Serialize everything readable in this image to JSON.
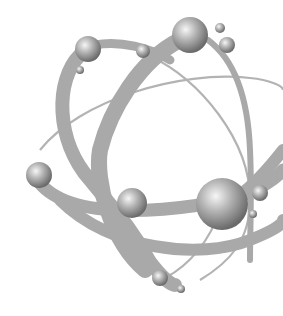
{
  "image": {
    "subject": "atom-illustration",
    "background": "#ffffff",
    "orbit_color": "#a9a9a9",
    "thin_orbit_color": "#b0b0b0",
    "sphere_highlight": "#f4f4f4",
    "sphere_mid": "#a8a8a8",
    "sphere_shadow": "#6e6e6e"
  },
  "spheres": [
    {
      "cx": 88,
      "cy": 49,
      "r": 13
    },
    {
      "cx": 143,
      "cy": 51,
      "r": 7
    },
    {
      "cx": 190,
      "cy": 35,
      "r": 18
    },
    {
      "cx": 220,
      "cy": 28,
      "r": 5
    },
    {
      "cx": 227,
      "cy": 45,
      "r": 8
    },
    {
      "cx": 80,
      "cy": 70,
      "r": 4
    },
    {
      "cx": 39,
      "cy": 175,
      "r": 13
    },
    {
      "cx": 132,
      "cy": 203,
      "r": 15
    },
    {
      "cx": 222,
      "cy": 204,
      "r": 26
    },
    {
      "cx": 260,
      "cy": 193,
      "r": 8
    },
    {
      "cx": 253,
      "cy": 214,
      "r": 4
    },
    {
      "cx": 160,
      "cy": 278,
      "r": 8
    },
    {
      "cx": 181,
      "cy": 289,
      "r": 4
    }
  ]
}
